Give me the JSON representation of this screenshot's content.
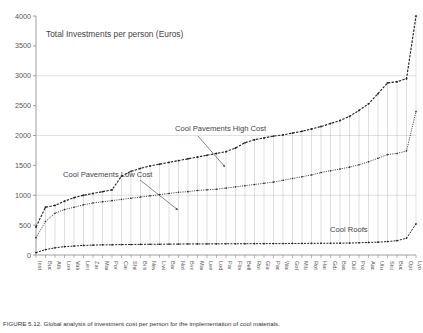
{
  "chart_data": {
    "type": "line",
    "title": "Total Investments per person (Euros)",
    "xlabel": "",
    "ylabel": "",
    "ylim": [
      0,
      4000
    ],
    "ytick_step": 500,
    "yticks": [
      0,
      500,
      1000,
      1500,
      2000,
      2500,
      3000,
      3500,
      4000
    ],
    "grid": true,
    "grid_lines": [
      1000,
      2000,
      3000
    ],
    "legend_position": "inline-annotations",
    "annotations": [
      {
        "text": "Cool Pavements High Cost",
        "series": "Cool Pavements High Cost"
      },
      {
        "text": "Cool Pavements Low Cost",
        "series": "Cool Pavements Low Cost"
      },
      {
        "text": "Cool Roofs",
        "series": "Cool Roofs"
      }
    ],
    "categories": [
      "Instabul",
      "Bucharest",
      "Athens",
      "London",
      "Valencia",
      "Leicester",
      "Zaragosa",
      "Madrid",
      "Portsmouth",
      "Cardiff",
      "Sheffield",
      "Bristol",
      "Newcastle",
      "Liverpool",
      "Barcelona",
      "Nottingham",
      "Birmingham",
      "Manchester",
      "Leeds",
      "Lodz",
      "Paris",
      "Florence",
      "Belfast",
      "Rome",
      "Glasgow",
      "Padua",
      "Warsaw",
      "Gothenburg",
      "Milan",
      "Rotterdam",
      "Hamburg",
      "Gdansk",
      "Basel",
      "Dublin",
      "Poznan",
      "Aachen",
      "Utrecht",
      "Strasbourg",
      "Budapest",
      "Oporto",
      "Lyon"
    ],
    "series": [
      {
        "name": "Cool Pavements High Cost",
        "values": [
          470,
          800,
          830,
          900,
          960,
          1000,
          1030,
          1060,
          1090,
          1320,
          1400,
          1450,
          1490,
          1520,
          1550,
          1580,
          1610,
          1640,
          1670,
          1700,
          1730,
          1790,
          1880,
          1930,
          1960,
          1990,
          2010,
          2040,
          2070,
          2110,
          2150,
          2200,
          2250,
          2320,
          2420,
          2530,
          2700,
          2880,
          2900,
          2950,
          4000
        ]
      },
      {
        "name": "Cool Pavements Low Cost",
        "values": [
          290,
          560,
          700,
          760,
          800,
          840,
          870,
          890,
          910,
          930,
          950,
          970,
          990,
          1010,
          1030,
          1050,
          1060,
          1080,
          1090,
          1100,
          1120,
          1140,
          1160,
          1180,
          1200,
          1220,
          1250,
          1280,
          1310,
          1340,
          1380,
          1410,
          1440,
          1470,
          1510,
          1560,
          1620,
          1680,
          1700,
          1740,
          2400
        ]
      },
      {
        "name": "Cool Roofs",
        "values": [
          40,
          90,
          120,
          140,
          150,
          160,
          165,
          170,
          170,
          175,
          175,
          178,
          180,
          180,
          182,
          183,
          185,
          185,
          186,
          187,
          188,
          188,
          189,
          190,
          190,
          191,
          192,
          193,
          194,
          195,
          196,
          197,
          198,
          200,
          205,
          210,
          215,
          225,
          240,
          280,
          520
        ]
      }
    ]
  },
  "caption": {
    "text": "FIGURE 5.12.  Global analysis of investment cost per person for the implementation of cool materials."
  },
  "colors": {
    "axis": "#888888",
    "grid": "#cccccc",
    "series": "#222222",
    "text": "#444444"
  }
}
